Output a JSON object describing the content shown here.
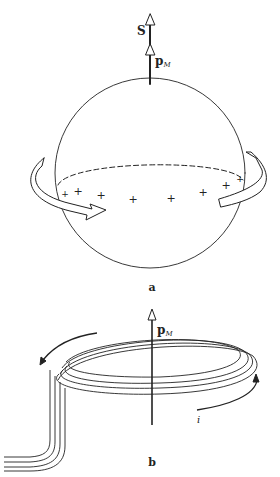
{
  "figure": {
    "panel_a": {
      "label": "a",
      "spin_vector_label": "S",
      "moment_label_main": "p",
      "moment_label_sub": "M",
      "charge_symbol": "+",
      "charge_count": 8,
      "rotation_arrow": "rotation-arrow"
    },
    "panel_b": {
      "label": "b",
      "moment_label_main": "p",
      "moment_label_sub": "M",
      "current_label": "i",
      "coil_turns": 3
    },
    "colors": {
      "line": "#222222",
      "background": "#ffffff"
    }
  }
}
